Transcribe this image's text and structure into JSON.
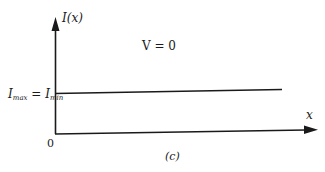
{
  "diagram": {
    "caption": "(c)",
    "y_axis_label": "I(x)",
    "x_axis_label": "x",
    "origin_label": "0",
    "condition_label": "V = 0",
    "level_label": {
      "left": "I",
      "left_sub": "max",
      "equals": " = ",
      "right": "I",
      "right_sub": "min"
    },
    "colors": {
      "line": "#1a1a1a",
      "background": "#ffffff"
    }
  }
}
